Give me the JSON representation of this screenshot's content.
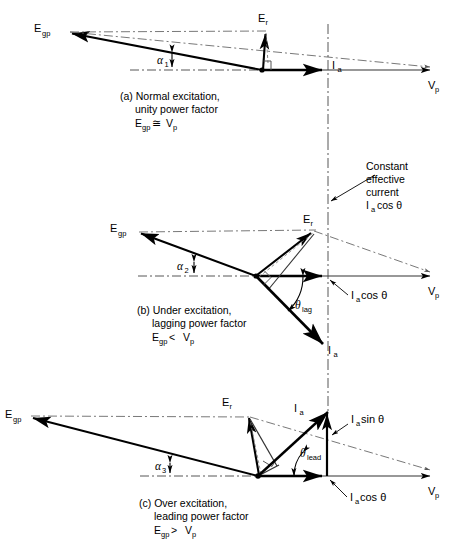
{
  "figure": {
    "type": "phasor-diagram",
    "title_absent": true,
    "axis_label_right": "V",
    "axis_label_right_sub": "p",
    "panels": [
      {
        "id": "a",
        "caption_lines": [
          "(a) Normal excitation,",
          "unity power factor"
        ],
        "caption_relation": "E",
        "caption_relation_sub": "gp",
        "caption_relation_op": "≅",
        "caption_relation_rhs": "V",
        "caption_relation_rhs_sub": "p",
        "labels": {
          "egp": "E",
          "egp_sub": "gp",
          "er": "E",
          "er_sub": "r",
          "ia": "I",
          "ia_sub": "a",
          "alpha": "α",
          "alpha_sub": "1",
          "vp": "V",
          "vp_sub": "p"
        }
      },
      {
        "id": "b",
        "caption_lines": [
          "(b) Under excitation,",
          "lagging power factor"
        ],
        "caption_relation": "E",
        "caption_relation_sub": "gp",
        "caption_relation_op": "<",
        "caption_relation_rhs": "V",
        "caption_relation_rhs_sub": "p",
        "labels": {
          "egp": "E",
          "egp_sub": "gp",
          "er": "E",
          "er_sub": "r",
          "ia": "I",
          "ia_sub": "a",
          "alpha": "α",
          "alpha_sub": "2",
          "theta": "θ",
          "theta_sub": "lag",
          "iacos": "I",
          "iacos_sub": "a",
          "iacos_rest": "cos θ",
          "vp": "V",
          "vp_sub": "p"
        }
      },
      {
        "id": "c",
        "caption_lines": [
          "(c) Over excitation,",
          "leading power factor"
        ],
        "caption_relation": "E",
        "caption_relation_sub": "gp",
        "caption_relation_op": ">",
        "caption_relation_rhs": "V",
        "caption_relation_rhs_sub": "p",
        "labels": {
          "egp": "E",
          "egp_sub": "gp",
          "er": "E",
          "er_sub": "r",
          "ia": "I",
          "ia_sub": "a",
          "alpha": "α",
          "alpha_sub": "3",
          "theta": "θ",
          "theta_sub": "lead",
          "iasin": "I",
          "iasin_sub": "a",
          "iasin_rest": "sin θ",
          "iacos": "I",
          "iacos_sub": "a",
          "iacos_rest": "cos θ",
          "vp": "V",
          "vp_sub": "p"
        }
      }
    ],
    "annotation": {
      "lines": [
        "Constant",
        "effective",
        "current"
      ],
      "symbol": "I",
      "symbol_sub": "a",
      "symbol_rest": "cos θ"
    },
    "colors": {
      "ink": "#000000",
      "background": "#ffffff",
      "thin_line": "#333333"
    }
  }
}
